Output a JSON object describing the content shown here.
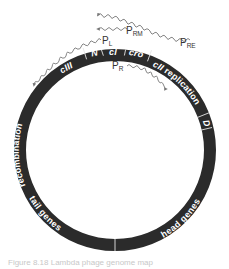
{
  "diagram": {
    "title": "Lambda phage genome map",
    "ring": {
      "center": [
        115,
        150
      ],
      "outer_radius": 101,
      "width": 12,
      "fill": "#2b2b2b",
      "divider_color": "#e6e6e6"
    },
    "segments": [
      {
        "id": "recombination",
        "label": "recombination",
        "italic": false,
        "start_deg": -105,
        "end_deg": -17
      },
      {
        "id": "cIII",
        "label": "cIII",
        "italic": true,
        "start_deg": -38,
        "end_deg": -17
      },
      {
        "id": "N",
        "label": "N",
        "italic": true,
        "start_deg": -17,
        "end_deg": -7
      },
      {
        "id": "cI",
        "label": "cI",
        "italic": true,
        "start_deg": -7,
        "end_deg": 6
      },
      {
        "id": "cro",
        "label": "cro",
        "italic": true,
        "start_deg": 6,
        "end_deg": 20
      },
      {
        "id": "cII",
        "label": "cII",
        "italic": true,
        "start_deg": 20,
        "end_deg": 32
      },
      {
        "id": "replication",
        "label": "replication",
        "italic": false,
        "start_deg": 32,
        "end_deg": 68
      },
      {
        "id": "D",
        "label": "D",
        "italic": true,
        "start_deg": 68,
        "end_deg": 77
      },
      {
        "id": "head-genes",
        "label": "head genes",
        "italic": false,
        "start_deg": 77,
        "end_deg": 180
      },
      {
        "id": "tail-genes",
        "label": "tail genes",
        "italic": false,
        "start_deg": 180,
        "end_deg": 255
      }
    ],
    "dividers_deg": [
      -17,
      -7,
      6,
      20,
      68,
      77,
      180
    ],
    "labels": {
      "recombination": "recombination",
      "cIII": "cIII",
      "N": "N",
      "cI": "cI",
      "cro": "cro",
      "cII": "cII",
      "replication": "replication",
      "D": "D",
      "head_genes": "head genes",
      "tail_genes": "tail genes"
    },
    "promoters": {
      "PL": {
        "main": "P",
        "sub": "L"
      },
      "PR": {
        "main": "P",
        "sub": "R"
      },
      "PRM": {
        "main": "P",
        "sub": "RM"
      },
      "PRE": {
        "main": "P",
        "sub": "RE"
      }
    },
    "caption": "Figure 8.18  Lambda phage genome map"
  }
}
